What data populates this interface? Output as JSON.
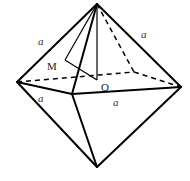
{
  "figure": {
    "type": "octahedron",
    "labels": {
      "edge_top_left": "a",
      "edge_top_right": "a",
      "edge_front_left": "a",
      "edge_front_right": "a",
      "point_m": "M",
      "point_o": "O"
    },
    "colors": {
      "stroke": "#000000",
      "background": "#ffffff"
    }
  }
}
